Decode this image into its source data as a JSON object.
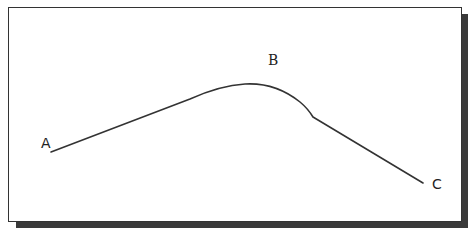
{
  "diagram": {
    "type": "curve-path",
    "points": [
      {
        "label": "A",
        "x": 51,
        "y": 152,
        "role": "start"
      },
      {
        "label": "B",
        "x": 245,
        "y": 84,
        "role": "peak"
      },
      {
        "label": "C",
        "x": 423,
        "y": 183,
        "role": "end"
      }
    ],
    "labels": {
      "a": "A",
      "b": "B",
      "c": "C"
    },
    "colors": {
      "line": "#333333",
      "frame_border": "#333333",
      "shadow": "#3a3a3a",
      "background": "#ffffff"
    }
  }
}
